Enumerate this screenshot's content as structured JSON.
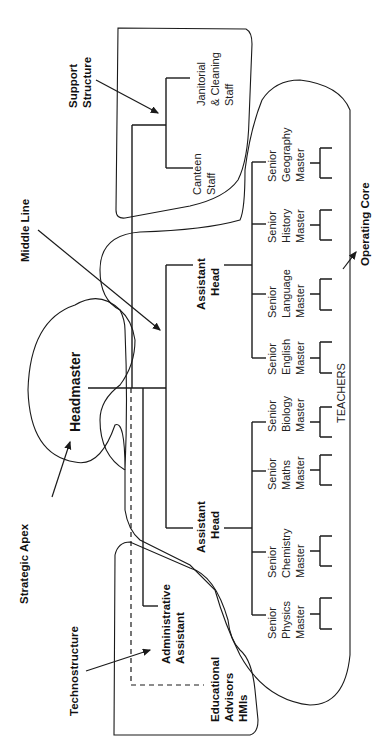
{
  "diagram": {
    "orientation": "rotated 90 degrees counter-clockwise",
    "regions": {
      "strategic_apex": "Strategic Apex",
      "middle_line": "Middle Line",
      "technostructure": "Technostructure",
      "support_structure": [
        "Support",
        "Structure"
      ],
      "operating_core": "Operating Core"
    },
    "nodes": {
      "headmaster": "Headmaster",
      "assistant_head_1": [
        "Assistant",
        "Head"
      ],
      "assistant_head_2": [
        "Assistant",
        "Head"
      ],
      "administrative_assistant": [
        "Administrative",
        "Assistant"
      ],
      "educational_advisors": [
        "Educational",
        "Advisors",
        "HMIs"
      ],
      "canteen_staff": [
        "Canteen",
        "Staff"
      ],
      "janitorial_staff": [
        "Janitorial",
        "& Cleaning",
        "Staff"
      ],
      "teachers": "TEACHERS",
      "masters": [
        [
          "Senior",
          "Physics",
          "Master"
        ],
        [
          "Senior",
          "Chemistry",
          "Master"
        ],
        [
          "Senior",
          "Maths",
          "Master"
        ],
        [
          "Senior",
          "Biology",
          "Master"
        ],
        [
          "Senior",
          "English",
          "Master"
        ],
        [
          "Senior",
          "Language",
          "Master"
        ],
        [
          "Senior",
          "History",
          "Master"
        ],
        [
          "Senior",
          "Geography",
          "Master"
        ]
      ]
    }
  }
}
